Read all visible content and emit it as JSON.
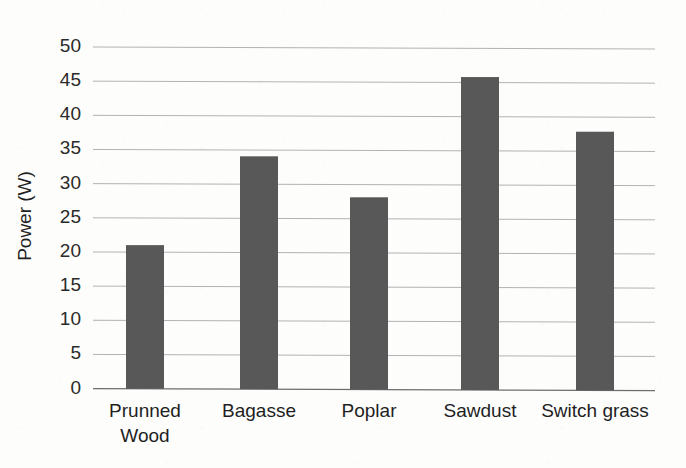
{
  "chart_data": {
    "type": "bar",
    "title": "",
    "xlabel": "",
    "ylabel": "Power (W)",
    "categories": [
      "Prunned Wood",
      "Bagasse",
      "Poplar",
      "Sawdust",
      "Switch grass"
    ],
    "category_lines": [
      [
        "Prunned",
        "Wood"
      ],
      [
        "Bagasse"
      ],
      [
        "Poplar"
      ],
      [
        "Sawdust"
      ],
      [
        "Switch grass"
      ]
    ],
    "values": [
      21,
      34,
      28,
      45.6,
      37.6
    ],
    "ylim": [
      0,
      50
    ],
    "ytick_step": 5,
    "yticks": [
      "50",
      "45",
      "40",
      "35",
      "30",
      "25",
      "20",
      "15",
      "10",
      "5",
      "0"
    ],
    "ytick_values": [
      50,
      45,
      40,
      35,
      30,
      25,
      20,
      15,
      10,
      5,
      0
    ],
    "grid": true,
    "legend": "none",
    "bar_color": "#585858",
    "gridline_color": "#9a9a9a",
    "background_color": "#fdfdfc",
    "text_color": "#1f1f1f"
  }
}
